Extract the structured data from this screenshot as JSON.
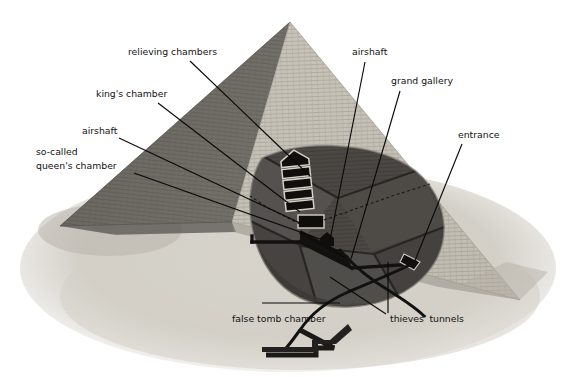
{
  "figure": {
    "background_color": "#ffffff",
    "ink_color": "#111111",
    "palette": {
      "sky": "#ffffff",
      "sand": "#d8d4cc",
      "sand_shadow": "#b9b4ab",
      "face_light": "#c9c4ba",
      "face_light_2": "#bdb8ae",
      "face_dark": "#6f6c66",
      "face_dark_2": "#5d5a55",
      "cut_fill": "#4a4744",
      "cut_fill_2": "#3e3b38",
      "passage": "#141312",
      "chamber_outline": "#d7d3c9"
    },
    "labels": [
      {
        "id": "relieving-chambers",
        "text": "relieving chambers",
        "x": 128,
        "y": 55,
        "anchor": "start",
        "leader": "190,61 L 310,176"
      },
      {
        "id": "kings-chamber",
        "text": "king's chamber",
        "x": 96,
        "y": 97,
        "anchor": "start",
        "leader": "158,103 L 300,212"
      },
      {
        "id": "airshaft-left",
        "text": "airshaft",
        "x": 82,
        "y": 134,
        "anchor": "start",
        "leader": "119,138 L 300,223"
      },
      {
        "id": "so-called-queens-chamber-line1",
        "text": "so-called",
        "x": 36,
        "y": 155,
        "anchor": "start",
        "leader": ""
      },
      {
        "id": "so-called-queens-chamber-line2",
        "text": "queen's chamber",
        "x": 36,
        "y": 169,
        "anchor": "start",
        "leader": "134,173 L 320,239"
      },
      {
        "id": "airshaft-right",
        "text": "airshaft",
        "x": 352,
        "y": 55,
        "anchor": "start",
        "leader": "365,62 L 330,240"
      },
      {
        "id": "grand-gallery",
        "text": "grand gallery",
        "x": 391,
        "y": 84,
        "anchor": "start",
        "leader": "400,91 L 351,259"
      },
      {
        "id": "entrance",
        "text": "entrance",
        "x": 458,
        "y": 138,
        "anchor": "start",
        "leader": "462,144 L 414,263"
      },
      {
        "id": "false-tomb-chamber",
        "text": "false tomb chamber",
        "x": 232,
        "y": 322,
        "anchor": "start",
        "leader": "262,303 L 340,303"
      },
      {
        "id": "thieves-tunnels",
        "text": "thieves' tunnels",
        "x": 390,
        "y": 322,
        "anchor": "start",
        "leader": "388,313 L 388,262"
      },
      {
        "id": "thieves-tunnels-second-leader",
        "text": "",
        "x": 0,
        "y": 0,
        "anchor": "start",
        "leader": "386,314 L 330,277"
      }
    ]
  }
}
